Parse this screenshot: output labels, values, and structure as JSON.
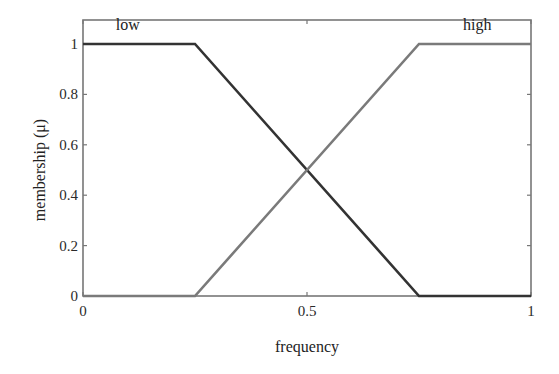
{
  "chart_data": {
    "type": "line",
    "title": "",
    "xlabel": "frequency",
    "ylabel": "membership (μ)",
    "xlim": [
      0,
      1
    ],
    "ylim": [
      0,
      1.1
    ],
    "grid": false,
    "x_ticks": [
      0,
      0.5,
      1
    ],
    "x_tick_labels": [
      "0",
      "0.5",
      "1"
    ],
    "y_ticks": [
      0,
      0.2,
      0.4,
      0.6,
      0.8,
      1
    ],
    "y_tick_labels": [
      "0",
      "0.2",
      "0.4",
      "0.6",
      "0.8",
      "1"
    ],
    "legend_position": "inline labels at top",
    "series": [
      {
        "name": "low",
        "color": "#333333",
        "x": [
          0,
          0.25,
          0.75,
          1
        ],
        "y": [
          1,
          1,
          0,
          0
        ]
      },
      {
        "name": "high",
        "color": "#7a7a7a",
        "x": [
          0,
          0.25,
          0.75,
          1
        ],
        "y": [
          0,
          0,
          1,
          1
        ]
      }
    ],
    "annotations": [
      {
        "text": "low",
        "x": 0.1,
        "y": 1.05
      },
      {
        "text": "high",
        "x": 0.88,
        "y": 1.05
      }
    ]
  }
}
